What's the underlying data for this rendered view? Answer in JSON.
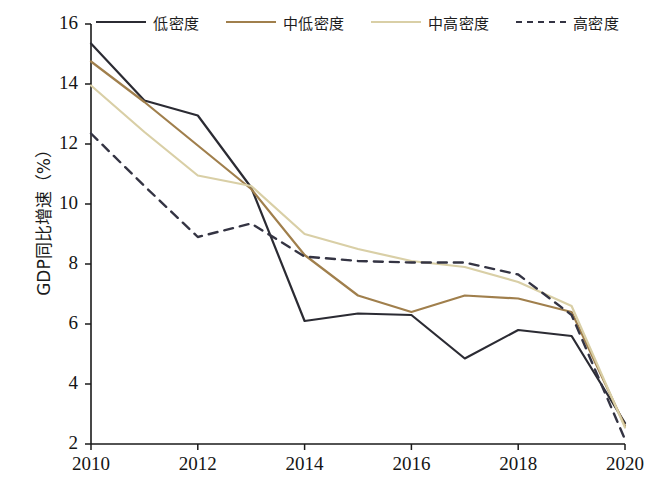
{
  "chart_data": {
    "type": "line",
    "title": "",
    "xlabel": "",
    "ylabel": "GDP同比增速（%）",
    "x": [
      2010,
      2011,
      2012,
      2013,
      2014,
      2015,
      2016,
      2017,
      2018,
      2019,
      2020
    ],
    "xlim": [
      2010,
      2020
    ],
    "ylim": [
      2,
      16
    ],
    "xticks": [
      "2010",
      "2012",
      "2014",
      "2016",
      "2018",
      "2020"
    ],
    "yticks": [
      "2",
      "4",
      "6",
      "8",
      "10",
      "12",
      "14",
      "16"
    ],
    "grid": false,
    "legend_position": "top",
    "series": [
      {
        "name": "低密度",
        "style": "solid",
        "color": "#2b2b33",
        "values": [
          15.35,
          13.45,
          12.95,
          10.55,
          6.1,
          6.35,
          6.3,
          4.85,
          5.8,
          5.6,
          2.7
        ]
      },
      {
        "name": "中低密度",
        "style": "solid",
        "color": "#a07f4c",
        "values": [
          14.75,
          13.4,
          11.95,
          10.5,
          8.3,
          6.95,
          6.4,
          6.95,
          6.85,
          6.4,
          2.6
        ]
      },
      {
        "name": "中高密度",
        "style": "solid",
        "color": "#d9cfa6",
        "values": [
          13.95,
          12.4,
          10.95,
          10.6,
          9.0,
          8.5,
          8.1,
          7.9,
          7.4,
          6.6,
          2.55
        ]
      },
      {
        "name": "高密度",
        "style": "dashed",
        "color": "#343443",
        "values": [
          12.35,
          10.6,
          8.9,
          9.35,
          8.25,
          8.1,
          8.05,
          8.05,
          7.65,
          6.3,
          2.15
        ]
      }
    ]
  },
  "legend": {
    "items": [
      {
        "label": "低密度"
      },
      {
        "label": "中低密度"
      },
      {
        "label": "中高密度"
      },
      {
        "label": "高密度"
      }
    ]
  }
}
